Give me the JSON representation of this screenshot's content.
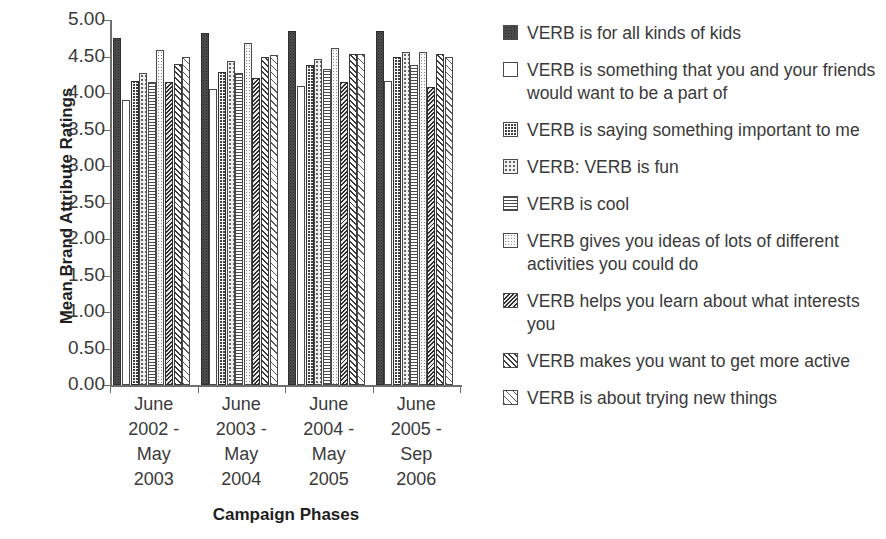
{
  "chart_data": {
    "type": "bar",
    "title": "",
    "xlabel": "Campaign Phases",
    "ylabel": "Mean Brand Attribute Ratings",
    "ylim": [
      0.0,
      5.0
    ],
    "ytick_step": 0.5,
    "grid": false,
    "legend_position": "right",
    "yticks": [
      "5.00",
      "4.50",
      "4.00",
      "3.50",
      "3.00",
      "2.50",
      "2.00",
      "1.50",
      "1.00",
      "0.50",
      "0.00"
    ],
    "ytick_values": [
      5.0,
      4.5,
      4.0,
      3.5,
      3.0,
      2.5,
      2.0,
      1.5,
      1.0,
      0.5,
      0.0
    ],
    "categories": [
      "June 2002 - May 2003",
      "June 2003 - May 2004",
      "June 2004 - May 2005",
      "June 2005 - Sep 2006"
    ],
    "category_label_lines": [
      [
        "June",
        "2002 -",
        "May",
        "2003"
      ],
      [
        "June",
        "2003 -",
        "May",
        "2004"
      ],
      [
        "June",
        "2004 -",
        "May",
        "2005"
      ],
      [
        "June",
        "2005 -",
        "Sep",
        "2006"
      ]
    ],
    "series": [
      {
        "name": "VERB is for all kinds of kids",
        "pattern": "dark-solid-speckle",
        "values": [
          4.75,
          4.82,
          4.85,
          4.85
        ]
      },
      {
        "name": "VERB is something that you and your friends would want to be a part of",
        "pattern": "open-white",
        "values": [
          3.9,
          4.05,
          4.1,
          4.17
        ]
      },
      {
        "name": "VERB is saying something important to me",
        "pattern": "dark-checkerboard",
        "values": [
          4.17,
          4.29,
          4.38,
          4.49
        ]
      },
      {
        "name": "VERB: VERB is fun",
        "pattern": "light-sparse-dots",
        "values": [
          4.28,
          4.44,
          4.47,
          4.56
        ]
      },
      {
        "name": "VERB is cool",
        "pattern": "horizontal-lines",
        "values": [
          4.15,
          4.27,
          4.33,
          4.39
        ]
      },
      {
        "name": "VERB gives you ideas of lots of different activities you could do",
        "pattern": "fine-dots",
        "values": [
          4.59,
          4.68,
          4.62,
          4.56
        ]
      },
      {
        "name": "VERB helps you learn about what interests you",
        "pattern": "dense-back-diagonal",
        "values": [
          4.15,
          4.21,
          4.15,
          4.08
        ]
      },
      {
        "name": "VERB makes you want to get more active",
        "pattern": "medium-forward-diagonal",
        "values": [
          4.4,
          4.5,
          4.53,
          4.53
        ]
      },
      {
        "name": "VERB is about trying new things",
        "pattern": "light-forward-diagonal",
        "values": [
          4.5,
          4.52,
          4.53,
          4.5
        ]
      }
    ]
  },
  "legend": {
    "items": [
      {
        "label": "VERB is for all kinds of kids"
      },
      {
        "label": "VERB is something that you and your friends would want to be a part of"
      },
      {
        "label": "VERB is saying something important to me"
      },
      {
        "label": "VERB: VERB is fun"
      },
      {
        "label": "VERB is cool"
      },
      {
        "label": "VERB gives you ideas of lots of different activities you could do"
      },
      {
        "label": "VERB helps you learn about what interests you"
      },
      {
        "label": "VERB makes you want to get more active"
      },
      {
        "label": "VERB is about trying new things"
      }
    ]
  },
  "axes": {
    "y_title": "Mean Brand Attribute Ratings",
    "x_title": "Campaign Phases"
  }
}
